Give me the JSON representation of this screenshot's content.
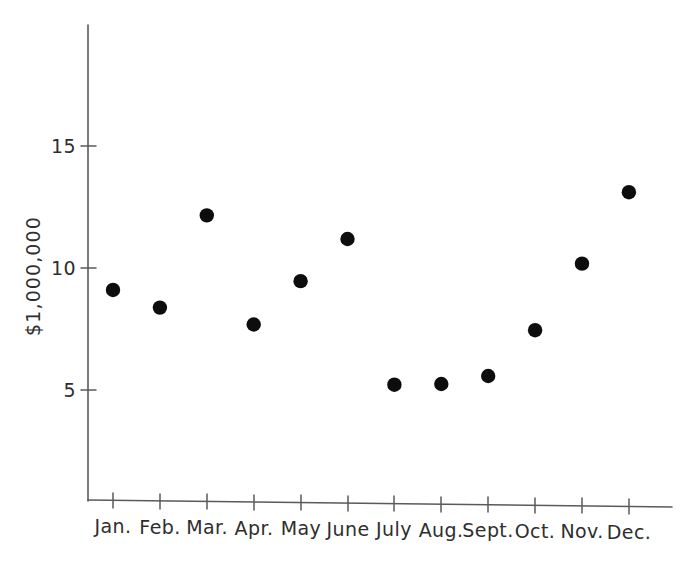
{
  "chart_data": {
    "type": "scatter",
    "title": "",
    "subtitle": "",
    "xlabel": "",
    "ylabel": "$1,000,000",
    "categories": [
      "Jan.",
      "Feb.",
      "Mar.",
      "Apr.",
      "May",
      "June",
      "July",
      "Aug.",
      "Sept.",
      "Oct.",
      "Nov.",
      "Dec."
    ],
    "values": [
      9.1,
      8.4,
      12.2,
      7.75,
      9.55,
      11.3,
      5.35,
      5.4,
      5.75,
      7.65,
      10.4,
      13.35
    ],
    "series": [
      {
        "name": "Monthly amount",
        "values": [
          9.1,
          8.4,
          12.2,
          7.75,
          9.55,
          11.3,
          5.35,
          5.4,
          5.75,
          7.65,
          10.4,
          13.35
        ]
      }
    ],
    "points": [
      {
        "x": "Jan.",
        "y": 9.1
      },
      {
        "x": "Feb.",
        "y": 8.4
      },
      {
        "x": "Mar.",
        "y": 12.2
      },
      {
        "x": "Apr.",
        "y": 7.75
      },
      {
        "x": "May",
        "y": 9.55
      },
      {
        "x": "June",
        "y": 11.3
      },
      {
        "x": "July",
        "y": 5.35
      },
      {
        "x": "Aug.",
        "y": 5.4
      },
      {
        "x": "Sept.",
        "y": 5.75
      },
      {
        "x": "Oct.",
        "y": 7.65
      },
      {
        "x": "Nov.",
        "y": 10.4
      },
      {
        "x": "Dec.",
        "y": 13.35
      }
    ],
    "ytick_labels": [
      "15",
      "10",
      "5"
    ],
    "ytick_values": [
      15,
      10,
      5
    ],
    "ylim": [
      0,
      19.5
    ],
    "xlim": [
      0,
      13
    ],
    "grid": false,
    "legend": null,
    "legend_position": "none",
    "marker": "filled-circle",
    "marker_color": "#0d0d0d",
    "axis_color": "#5a5a5a",
    "background_color": "#ffffff"
  }
}
